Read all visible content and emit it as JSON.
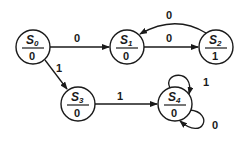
{
  "diagram": {
    "type": "moore-state-machine",
    "states": [
      {
        "id": "S0",
        "name": "S",
        "sub": "0",
        "output": "0",
        "cx": 33,
        "cy": 47
      },
      {
        "id": "S1",
        "name": "S",
        "sub": "1",
        "output": "0",
        "cx": 127,
        "cy": 47
      },
      {
        "id": "S2",
        "name": "S",
        "sub": "2",
        "output": "1",
        "cx": 216,
        "cy": 47
      },
      {
        "id": "S3",
        "name": "S",
        "sub": "3",
        "output": "0",
        "cx": 78,
        "cy": 104
      },
      {
        "id": "S4",
        "name": "S",
        "sub": "4",
        "output": "0",
        "cx": 175,
        "cy": 104
      }
    ],
    "transitions": [
      {
        "from": "S0",
        "to": "S1",
        "input": "0"
      },
      {
        "from": "S0",
        "to": "S3",
        "input": "1"
      },
      {
        "from": "S1",
        "to": "S2",
        "input": "0"
      },
      {
        "from": "S2",
        "to": "S1",
        "input": "0"
      },
      {
        "from": "S3",
        "to": "S4",
        "input": "1"
      },
      {
        "from": "S4",
        "to": "S4",
        "input": "1"
      },
      {
        "from": "S4",
        "to": "S4",
        "input": "0"
      }
    ]
  }
}
